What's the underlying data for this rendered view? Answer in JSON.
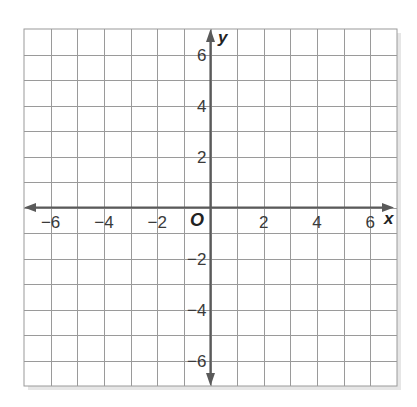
{
  "chart_data": {
    "type": "coordinate-grid",
    "title": "",
    "xlabel": "x",
    "ylabel": "y",
    "origin_label": "O",
    "xlim": [
      -7,
      7
    ],
    "ylim": [
      -7,
      7
    ],
    "grid": true,
    "grid_step": 1,
    "x_ticks": [
      -6,
      -4,
      -2,
      2,
      4,
      6
    ],
    "y_ticks": [
      6,
      4,
      2,
      -2,
      -4,
      -6
    ],
    "x_tick_labels": [
      "−6",
      "−4",
      "−2",
      "2",
      "4",
      "6"
    ],
    "y_tick_labels": [
      "6",
      "4",
      "2",
      "−2",
      "−4",
      "−6"
    ],
    "series": []
  },
  "colors": {
    "grid": "#9a9a9a",
    "axis": "#5a5a5a",
    "text": "#3a3a3a"
  }
}
